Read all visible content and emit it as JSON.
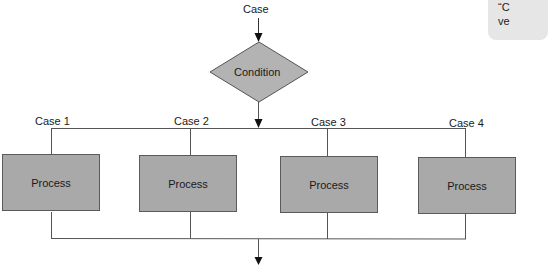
{
  "diagram": {
    "entry_label": "Case",
    "decision": {
      "label": "Condition",
      "shape": "diamond",
      "fill": "#b3b3b3"
    },
    "cases": [
      {
        "label": "Case 1",
        "process_label": "Process"
      },
      {
        "label": "Case 2",
        "process_label": "Process"
      },
      {
        "label": "Case 3",
        "process_label": "Process"
      },
      {
        "label": "Case 4",
        "process_label": "Process"
      }
    ],
    "process_fill": "#a9a9a9",
    "line_color": "#555555"
  },
  "callout": {
    "line1": "“C",
    "line2": "ve"
  }
}
